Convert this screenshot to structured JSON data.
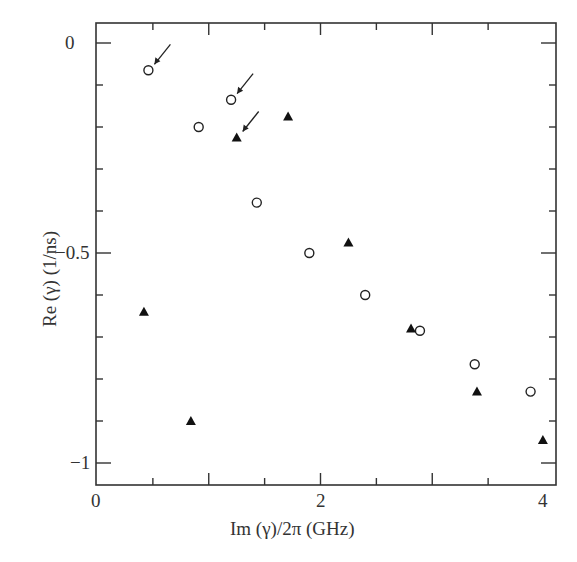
{
  "chart_data": {
    "type": "scatter",
    "title": "",
    "xlabel": "Im (γ)/2π (GHz)",
    "ylabel": "Re (γ) (1/ns)",
    "xlim": [
      0,
      4.1
    ],
    "ylim": [
      -1.05,
      0.05
    ],
    "x_ticks": [
      0,
      2,
      4
    ],
    "x_tick_labels": [
      "0",
      "2",
      "4"
    ],
    "y_ticks": [
      0,
      -0.5,
      -1
    ],
    "y_tick_labels": [
      "0",
      "-0.5",
      "-1"
    ],
    "grid": false,
    "legend": null,
    "series": [
      {
        "name": "open-circles",
        "marker": "circle-open",
        "x": [
          0.46,
          0.91,
          1.2,
          1.43,
          1.9,
          2.4,
          2.89,
          3.38,
          3.88
        ],
        "y": [
          -0.065,
          -0.2,
          -0.135,
          -0.38,
          -0.5,
          -0.6,
          -0.685,
          -0.765,
          -0.83
        ]
      },
      {
        "name": "filled-triangles",
        "marker": "triangle-filled",
        "x": [
          0.42,
          0.84,
          1.25,
          1.71,
          2.25,
          2.81,
          3.4,
          3.99
        ],
        "y": [
          -0.64,
          -0.9,
          -0.225,
          -0.175,
          -0.475,
          -0.68,
          -0.83,
          -0.945
        ]
      }
    ],
    "annotations": [
      {
        "type": "arrow",
        "target": [
          0.46,
          -0.065
        ]
      },
      {
        "type": "arrow",
        "target": [
          1.2,
          -0.135
        ]
      },
      {
        "type": "arrow",
        "target": [
          1.25,
          -0.225
        ]
      }
    ]
  },
  "labels": {
    "xlabel": "Im (γ)/2π (GHz)",
    "ylabel": "Re (γ) (1/ns)",
    "x0": "0",
    "x2": "2",
    "x4": "4",
    "y0": "0",
    "y05": "−0.5",
    "y1": "−1"
  }
}
